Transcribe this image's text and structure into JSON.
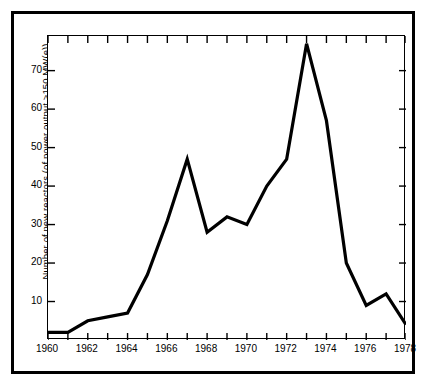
{
  "chart_data": {
    "type": "line",
    "title": "",
    "xlabel": "",
    "ylabel": "Number of new reactors (of power output >150 MW(e))",
    "xlim": [
      1960,
      1978
    ],
    "ylim": [
      0,
      79
    ],
    "grid": false,
    "legend": null,
    "x": [
      1960,
      1961,
      1962,
      1963,
      1964,
      1965,
      1966,
      1967,
      1968,
      1969,
      1970,
      1971,
      1972,
      1973,
      1974,
      1975,
      1976,
      1977,
      1978
    ],
    "values": [
      2,
      2,
      5,
      6,
      7,
      17,
      31,
      47,
      28,
      32,
      30,
      40,
      47,
      77,
      57,
      20,
      9,
      12,
      4
    ],
    "xticklabels": [
      "1960",
      "1962",
      "1964",
      "1966",
      "1968",
      "1970",
      "1972",
      "1974",
      "1976",
      "1978"
    ],
    "xtickvalues": [
      1960,
      1962,
      1964,
      1966,
      1968,
      1970,
      1972,
      1974,
      1976,
      1978
    ],
    "yticklabels": [
      "10",
      "20",
      "30",
      "40",
      "50",
      "60",
      "70"
    ],
    "ytickvalues": [
      10,
      20,
      30,
      40,
      50,
      60,
      70
    ],
    "series": [
      {
        "name": "Number of new reactors (of power output >150 MW(e))",
        "values": [
          2,
          2,
          5,
          6,
          7,
          17,
          31,
          47,
          28,
          32,
          30,
          40,
          47,
          77,
          57,
          20,
          9,
          12,
          4
        ],
        "color": "#000000"
      }
    ],
    "colors": {
      "line": "#000000",
      "axis": "#000000",
      "background": "#ffffff",
      "frame": "#000000"
    }
  }
}
